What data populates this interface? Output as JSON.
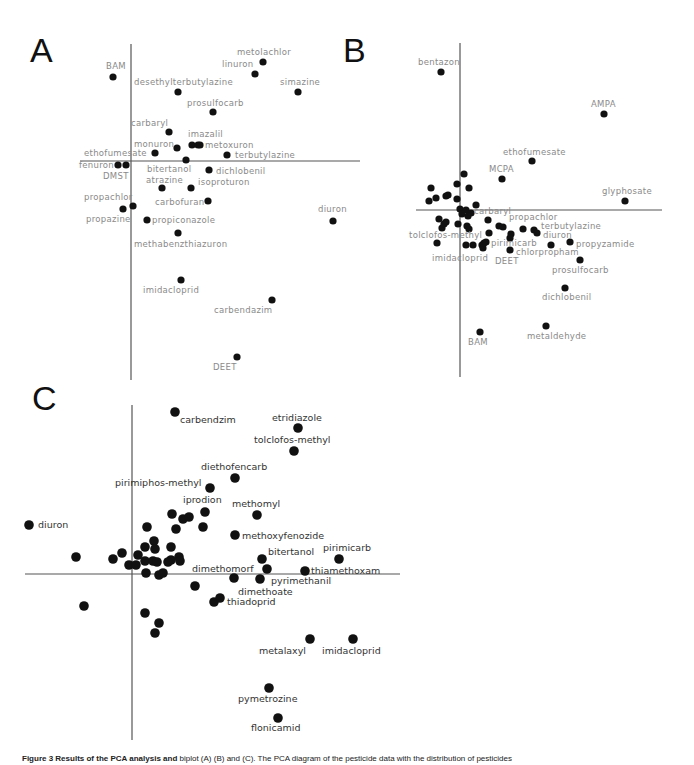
{
  "chart_data": [
    {
      "panel": "A",
      "type": "scatter",
      "title": "A",
      "xlabel": "",
      "ylabel": "",
      "grid": false,
      "axes": {
        "v_x": 131,
        "v_y1": 44,
        "v_y2": 380,
        "h_y": 161,
        "h_x1": 80,
        "h_x2": 360
      },
      "letter": {
        "x": 30,
        "y": 62
      },
      "points": [
        {
          "name": "metolachlor",
          "x": 263,
          "y": 62,
          "lx": 237,
          "ly": 55,
          "anchor": "start"
        },
        {
          "name": "linuron",
          "x": 255,
          "y": 74,
          "lx": 222,
          "ly": 67,
          "anchor": "start"
        },
        {
          "name": "BAM",
          "x": 113,
          "y": 77,
          "lx": 106,
          "ly": 69,
          "anchor": "start"
        },
        {
          "name": "desethylterbutylazine",
          "x": 178,
          "y": 92,
          "lx": 134,
          "ly": 85,
          "anchor": "start"
        },
        {
          "name": "simazine",
          "x": 298,
          "y": 92,
          "lx": 280,
          "ly": 85,
          "anchor": "start"
        },
        {
          "name": "prosulfocarb",
          "x": 213,
          "y": 112,
          "lx": 187,
          "ly": 106,
          "anchor": "start"
        },
        {
          "name": "carbaryl",
          "x": 169,
          "y": 132,
          "lx": 131,
          "ly": 126,
          "anchor": "start"
        },
        {
          "name": "imazalil",
          "x": 192,
          "y": 145,
          "lx": 188,
          "ly": 137,
          "anchor": "start"
        },
        {
          "name": "",
          "x": 198,
          "y": 145
        },
        {
          "name": "metoxuron",
          "x": 200,
          "y": 145,
          "lx": 205,
          "ly": 148,
          "anchor": "start"
        },
        {
          "name": "monuron",
          "x": 177,
          "y": 148,
          "lx": 134,
          "ly": 147,
          "anchor": "start"
        },
        {
          "name": "ethofumesate",
          "x": 155,
          "y": 153,
          "lx": 84,
          "ly": 156,
          "anchor": "start"
        },
        {
          "name": "terbutylazine",
          "x": 227,
          "y": 155,
          "lx": 235,
          "ly": 158,
          "anchor": "start"
        },
        {
          "name": "",
          "x": 186,
          "y": 160
        },
        {
          "name": "fenuron",
          "x": 118,
          "y": 165,
          "lx": 79,
          "ly": 168,
          "anchor": "start"
        },
        {
          "name": "DMST",
          "x": 126,
          "y": 165,
          "lx": 103,
          "ly": 179,
          "anchor": "start"
        },
        {
          "name": "bitertanol",
          "x": 0,
          "y": 0,
          "lx": 147,
          "ly": 172,
          "anchor": "start",
          "label_only": true
        },
        {
          "name": "dichlobenil",
          "x": 209,
          "y": 170,
          "lx": 216,
          "ly": 174,
          "anchor": "start"
        },
        {
          "name": "atrazine",
          "x": 162,
          "y": 188,
          "lx": 146,
          "ly": 183,
          "anchor": "start"
        },
        {
          "name": "isoproturon",
          "x": 191,
          "y": 188,
          "lx": 198,
          "ly": 185,
          "anchor": "start"
        },
        {
          "name": "carbofuran",
          "x": 208,
          "y": 201,
          "lx": 155,
          "ly": 205,
          "anchor": "start"
        },
        {
          "name": "propachlor",
          "x": 133,
          "y": 206,
          "lx": 84,
          "ly": 200,
          "anchor": "start"
        },
        {
          "name": "propazine",
          "x": 123,
          "y": 209,
          "lx": 86,
          "ly": 222,
          "anchor": "start"
        },
        {
          "name": "propiconazole",
          "x": 147,
          "y": 220,
          "lx": 152,
          "ly": 223,
          "anchor": "start"
        },
        {
          "name": "methabenzthiazuron",
          "x": 178,
          "y": 233,
          "lx": 134,
          "ly": 247,
          "anchor": "start"
        },
        {
          "name": "diuron",
          "x": 333,
          "y": 221,
          "lx": 318,
          "ly": 212,
          "anchor": "start"
        },
        {
          "name": "imidacloprid",
          "x": 181,
          "y": 280,
          "lx": 143,
          "ly": 293,
          "anchor": "start"
        },
        {
          "name": "carbendazim",
          "x": 272,
          "y": 300,
          "lx": 214,
          "ly": 313,
          "anchor": "start"
        },
        {
          "name": "DEET",
          "x": 237,
          "y": 357,
          "lx": 213,
          "ly": 370,
          "anchor": "start"
        }
      ]
    },
    {
      "panel": "B",
      "type": "scatter",
      "title": "B",
      "xlabel": "",
      "ylabel": "",
      "grid": false,
      "axes": {
        "v_x": 460,
        "v_y1": 43,
        "v_y2": 377,
        "h_y": 210,
        "h_x1": 416,
        "h_x2": 662
      },
      "letter": {
        "x": 343,
        "y": 62
      },
      "points": [
        {
          "name": "bentazon",
          "x": 441,
          "y": 72,
          "lx": 418,
          "ly": 65,
          "anchor": "start"
        },
        {
          "name": "AMPA",
          "x": 604,
          "y": 114,
          "lx": 591,
          "ly": 107,
          "anchor": "start"
        },
        {
          "name": "ethofumesate",
          "x": 532,
          "y": 161,
          "lx": 503,
          "ly": 155,
          "anchor": "start"
        },
        {
          "name": "MCPA",
          "x": 502,
          "y": 179,
          "lx": 489,
          "ly": 172,
          "anchor": "start"
        },
        {
          "name": "glyphosate",
          "x": 625,
          "y": 201,
          "lx": 602,
          "ly": 194,
          "anchor": "start"
        },
        {
          "name": "",
          "x": 464,
          "y": 174
        },
        {
          "name": "",
          "x": 457,
          "y": 184
        },
        {
          "name": "",
          "x": 469,
          "y": 188
        },
        {
          "name": "",
          "x": 431,
          "y": 188
        },
        {
          "name": "",
          "x": 446,
          "y": 196
        },
        {
          "name": "",
          "x": 448,
          "y": 195
        },
        {
          "name": "",
          "x": 436,
          "y": 198
        },
        {
          "name": "",
          "x": 429,
          "y": 201
        },
        {
          "name": "",
          "x": 457,
          "y": 199
        },
        {
          "name": "",
          "x": 476,
          "y": 205
        },
        {
          "name": "",
          "x": 460,
          "y": 209
        },
        {
          "name": "",
          "x": 466,
          "y": 210
        },
        {
          "name": "",
          "x": 471,
          "y": 213
        },
        {
          "name": "",
          "x": 462,
          "y": 214
        },
        {
          "name": "carbaryl",
          "x": 468,
          "y": 216,
          "lx": 474,
          "ly": 214,
          "anchor": "start"
        },
        {
          "name": "",
          "x": 439,
          "y": 219
        },
        {
          "name": "",
          "x": 446,
          "y": 222
        },
        {
          "name": "",
          "x": 442,
          "y": 228
        },
        {
          "name": "",
          "x": 444,
          "y": 224
        },
        {
          "name": "",
          "x": 458,
          "y": 224
        },
        {
          "name": "",
          "x": 467,
          "y": 226
        },
        {
          "name": "",
          "x": 469,
          "y": 229
        },
        {
          "name": "",
          "x": 488,
          "y": 220
        },
        {
          "name": "propachlor",
          "x": 499,
          "y": 226,
          "lx": 509,
          "ly": 220,
          "anchor": "start"
        },
        {
          "name": "",
          "x": 503,
          "y": 227
        },
        {
          "name": "terbutylazine",
          "x": 523,
          "y": 229,
          "lx": 541,
          "ly": 229,
          "anchor": "start"
        },
        {
          "name": "",
          "x": 534,
          "y": 230
        },
        {
          "name": "diuron",
          "x": 537,
          "y": 233,
          "lx": 543,
          "ly": 238,
          "anchor": "start"
        },
        {
          "name": "",
          "x": 489,
          "y": 233
        },
        {
          "name": "",
          "x": 511,
          "y": 234
        },
        {
          "name": "",
          "x": 510,
          "y": 238
        },
        {
          "name": "tolclofos-methyl",
          "x": 437,
          "y": 243,
          "lx": 409,
          "ly": 238,
          "anchor": "start"
        },
        {
          "name": "",
          "x": 466,
          "y": 245
        },
        {
          "name": "",
          "x": 473,
          "y": 245
        },
        {
          "name": "",
          "x": 482,
          "y": 245
        },
        {
          "name": "",
          "x": 484,
          "y": 243
        },
        {
          "name": "",
          "x": 483,
          "y": 248
        },
        {
          "name": "pirimicarb",
          "x": 486,
          "y": 242,
          "lx": 491,
          "ly": 246,
          "anchor": "start"
        },
        {
          "name": "chlorpropham",
          "x": 510,
          "y": 250,
          "lx": 516,
          "ly": 255,
          "anchor": "start"
        },
        {
          "name": "imidacloprid",
          "x": 0,
          "y": 0,
          "lx": 432,
          "ly": 261,
          "anchor": "start",
          "label_only": true
        },
        {
          "name": "DEET",
          "x": 0,
          "y": 0,
          "lx": 495,
          "ly": 264,
          "anchor": "start",
          "label_only": true
        },
        {
          "name": "",
          "x": 551,
          "y": 245
        },
        {
          "name": "propyzamide",
          "x": 570,
          "y": 242,
          "lx": 576,
          "ly": 247,
          "anchor": "start"
        },
        {
          "name": "prosulfocarb",
          "x": 580,
          "y": 260,
          "lx": 552,
          "ly": 273,
          "anchor": "start"
        },
        {
          "name": "dichlobenil",
          "x": 565,
          "y": 288,
          "lx": 542,
          "ly": 300,
          "anchor": "start"
        },
        {
          "name": "BAM",
          "x": 480,
          "y": 332,
          "lx": 468,
          "ly": 345,
          "anchor": "start"
        },
        {
          "name": "metaldehyde",
          "x": 546,
          "y": 326,
          "lx": 527,
          "ly": 339,
          "anchor": "start"
        }
      ]
    },
    {
      "panel": "C",
      "type": "scatter",
      "title": "C",
      "xlabel": "",
      "ylabel": "",
      "grid": false,
      "axes": {
        "v_x": 132,
        "v_y1": 405,
        "v_y2": 740,
        "h_y": 574,
        "h_x1": 25,
        "h_x2": 400
      },
      "letter": {
        "x": 32,
        "y": 410
      },
      "points": [
        {
          "name": "carbendzim",
          "x": 175,
          "y": 412,
          "lx": 180,
          "ly": 423,
          "anchor": "start"
        },
        {
          "name": "etridiazole",
          "x": 298,
          "y": 428,
          "lx": 272,
          "ly": 421,
          "anchor": "start"
        },
        {
          "name": "tolclofos-methyl",
          "x": 294,
          "y": 451,
          "lx": 254,
          "ly": 443,
          "anchor": "start"
        },
        {
          "name": "diethofencarb",
          "x": 235,
          "y": 478,
          "lx": 201,
          "ly": 470,
          "anchor": "start"
        },
        {
          "name": "pirimiphos-methyl",
          "x": 210,
          "y": 488,
          "lx": 115,
          "ly": 486,
          "anchor": "start"
        },
        {
          "name": "iprodion",
          "x": 205,
          "y": 512,
          "lx": 183,
          "ly": 503,
          "anchor": "start"
        },
        {
          "name": "methomyl",
          "x": 257,
          "y": 515,
          "lx": 232,
          "ly": 507,
          "anchor": "start"
        },
        {
          "name": "",
          "x": 172,
          "y": 514
        },
        {
          "name": "",
          "x": 183,
          "y": 519
        },
        {
          "name": "",
          "x": 189,
          "y": 517
        },
        {
          "name": "",
          "x": 147,
          "y": 527
        },
        {
          "name": "",
          "x": 176,
          "y": 529
        },
        {
          "name": "",
          "x": 203,
          "y": 527
        },
        {
          "name": "diuron",
          "x": 29,
          "y": 525,
          "lx": 38,
          "ly": 528,
          "anchor": "start"
        },
        {
          "name": "methoxyfenozide",
          "x": 235,
          "y": 535,
          "lx": 242,
          "ly": 539,
          "anchor": "start"
        },
        {
          "name": "",
          "x": 154,
          "y": 541
        },
        {
          "name": "",
          "x": 145,
          "y": 547
        },
        {
          "name": "",
          "x": 155,
          "y": 549
        },
        {
          "name": "",
          "x": 171,
          "y": 547
        },
        {
          "name": "",
          "x": 138,
          "y": 555
        },
        {
          "name": "",
          "x": 171,
          "y": 560
        },
        {
          "name": "",
          "x": 179,
          "y": 557
        },
        {
          "name": "",
          "x": 180,
          "y": 561
        },
        {
          "name": "",
          "x": 122,
          "y": 553
        },
        {
          "name": "",
          "x": 113,
          "y": 559
        },
        {
          "name": "",
          "x": 76,
          "y": 557
        },
        {
          "name": "",
          "x": 145,
          "y": 561
        },
        {
          "name": "",
          "x": 153,
          "y": 561
        },
        {
          "name": "",
          "x": 157,
          "y": 562
        },
        {
          "name": "",
          "x": 168,
          "y": 562
        },
        {
          "name": "",
          "x": 129,
          "y": 565
        },
        {
          "name": "",
          "x": 136,
          "y": 565
        },
        {
          "name": "",
          "x": 146,
          "y": 573
        },
        {
          "name": "",
          "x": 159,
          "y": 575
        },
        {
          "name": "",
          "x": 163,
          "y": 573
        },
        {
          "name": "bitertanol",
          "x": 262,
          "y": 559,
          "lx": 268,
          "ly": 555,
          "anchor": "start"
        },
        {
          "name": "pirimicarb",
          "x": 339,
          "y": 559,
          "lx": 323,
          "ly": 551,
          "anchor": "start"
        },
        {
          "name": "dimethomorf",
          "x": 267,
          "y": 569,
          "lx": 192,
          "ly": 572,
          "anchor": "start"
        },
        {
          "name": "thiamethoxam",
          "x": 305,
          "y": 571,
          "lx": 311,
          "ly": 574,
          "anchor": "start"
        },
        {
          "name": "",
          "x": 234,
          "y": 578
        },
        {
          "name": "pyrimethanil",
          "x": 260,
          "y": 579,
          "lx": 271,
          "ly": 584,
          "anchor": "start"
        },
        {
          "name": "dimethoate",
          "x": 0,
          "y": 0,
          "lx": 238,
          "ly": 595,
          "anchor": "start",
          "label_only": true
        },
        {
          "name": "",
          "x": 195,
          "y": 586
        },
        {
          "name": "thiadoprid",
          "x": 214,
          "y": 602,
          "lx": 227,
          "ly": 605,
          "anchor": "start"
        },
        {
          "name": "",
          "x": 220,
          "y": 598
        },
        {
          "name": "",
          "x": 84,
          "y": 606
        },
        {
          "name": "",
          "x": 145,
          "y": 613
        },
        {
          "name": "",
          "x": 159,
          "y": 623
        },
        {
          "name": "",
          "x": 155,
          "y": 633
        },
        {
          "name": "metalaxyl",
          "x": 310,
          "y": 639,
          "lx": 259,
          "ly": 654,
          "anchor": "start"
        },
        {
          "name": "imidacloprid",
          "x": 353,
          "y": 639,
          "lx": 322,
          "ly": 654,
          "anchor": "start"
        },
        {
          "name": "pymetrozine",
          "x": 269,
          "y": 688,
          "lx": 238,
          "ly": 702,
          "anchor": "start"
        },
        {
          "name": "flonicamid",
          "x": 278,
          "y": 718,
          "lx": 251,
          "ly": 731,
          "anchor": "start"
        }
      ]
    }
  ],
  "caption": {
    "label": "Figure 3 Results of the PCA analysis and",
    "text": " biplot (A) (B) and (C). The PCA diagram of the pesticide data with the distribution of pesticides"
  }
}
